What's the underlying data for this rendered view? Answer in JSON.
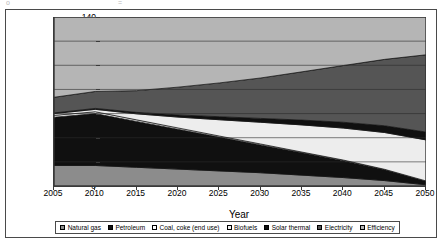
{
  "page": {
    "artifact_left": "o",
    "artifact_right": "="
  },
  "chart_data": {
    "type": "area",
    "stacked": true,
    "title": "",
    "xlabel": "Year",
    "ylabel": "Quadrillion Btu",
    "x": [
      2005,
      2010,
      2015,
      2020,
      2025,
      2030,
      2035,
      2040,
      2045,
      2050
    ],
    "xlim": [
      2005,
      2050
    ],
    "ylim": [
      0,
      140
    ],
    "xticks": [
      "2005",
      "2010",
      "2015",
      "2020",
      "2025",
      "2030",
      "2035",
      "2040",
      "2045",
      "2050"
    ],
    "yticks": [
      "0",
      "20",
      "40",
      "60",
      "80",
      "100",
      "120",
      "140"
    ],
    "grid": true,
    "grid_axis": "y",
    "legend_position": "bottom",
    "series": [
      {
        "name": "Natural gas",
        "color": "#8c8c8c",
        "values": [
          17,
          17,
          15.5,
          14,
          12.5,
          11,
          9,
          7,
          4.5,
          1
        ]
      },
      {
        "name": "Petroleum",
        "color": "#101010",
        "values": [
          40,
          43,
          38,
          33,
          28,
          23,
          18.5,
          14,
          9,
          3
        ]
      },
      {
        "name": "Coal, coke (end use)",
        "color": "#ffffff",
        "values": [
          1.5,
          1.5,
          1.3,
          1.1,
          0.9,
          0.8,
          0.6,
          0.5,
          0.3,
          0.2
        ]
      },
      {
        "name": "Biofuels",
        "color": "#ededed",
        "values": [
          1.5,
          2,
          5,
          9,
          13.5,
          18,
          22.5,
          26.5,
          30.5,
          34
        ]
      },
      {
        "name": "Solar thermal",
        "color": "#101010",
        "values": [
          0.5,
          0.8,
          1.2,
          1.8,
          2.5,
          3.2,
          4,
          4.8,
          5.6,
          6.5
        ]
      },
      {
        "name": "Electricity",
        "color": "#555555",
        "values": [
          13,
          14,
          18,
          23,
          28,
          33.5,
          40,
          47,
          55,
          64
        ]
      },
      {
        "name": "Efficiency",
        "color": "#b5b5b5",
        "values": [
          66.5,
          61.7,
          60.9,
          58.1,
          54.6,
          50.5,
          45.4,
          40.2,
          35.1,
          31.3
        ]
      }
    ],
    "totals": [
      140,
      140,
      140,
      140,
      140,
      140,
      140,
      140,
      140,
      140
    ],
    "legend": [
      {
        "label": "Natural gas",
        "color": "#8c8c8c"
      },
      {
        "label": "Petroleum",
        "color": "#101010"
      },
      {
        "label": "Coal, coke (end use)",
        "color": "#ffffff"
      },
      {
        "label": "Biofuels",
        "color": "#ededed"
      },
      {
        "label": "Solar thermal",
        "color": "#101010"
      },
      {
        "label": "Electricity",
        "color": "#555555"
      },
      {
        "label": "Efficiency",
        "color": "#b5b5b5"
      }
    ]
  }
}
